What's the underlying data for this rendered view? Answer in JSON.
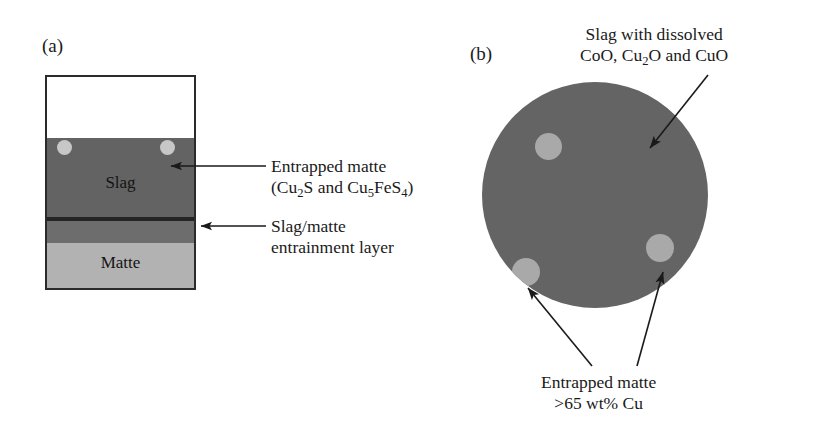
{
  "figure": {
    "panels": [
      {
        "id": "a",
        "label": "(a)",
        "layers": [
          {
            "name": "gas",
            "label": "",
            "color": "#ffffff"
          },
          {
            "name": "slag",
            "label": "Slag",
            "color": "#636363"
          },
          {
            "name": "divider",
            "label": "",
            "color": "#242424"
          },
          {
            "name": "entrainment",
            "label": "",
            "color": "#6d6d6d"
          },
          {
            "name": "matte",
            "label": "Matte",
            "color": "#b2b2b2"
          }
        ],
        "inclusion_color": "#c7c7c7",
        "callouts": [
          {
            "name": "entrapped-matte",
            "line1": "Entrapped matte",
            "line2_prefix": "(Cu",
            "line2_sub1": "2",
            "line2_mid": "S and Cu",
            "line2_sub2": "5",
            "line2_mid2": "FeS",
            "line2_sub3": "4",
            "line2_suffix": ")"
          },
          {
            "name": "slag-matte-entrainment",
            "line1": "Slag/matte",
            "line2": "entrainment layer"
          }
        ]
      },
      {
        "id": "b",
        "label": "(b)",
        "body_color": "#646464",
        "inclusion_color": "#a9a9a9",
        "callouts": [
          {
            "name": "slag-with-dissolved-oxides",
            "line1": "Slag with dissolved",
            "line2_prefix": "CoO, Cu",
            "line2_sub": "2",
            "line2_suffix": "O and CuO"
          },
          {
            "name": "entrapped-matte-copper",
            "line1": "Entrapped matte",
            "line2": ">65 wt% Cu"
          }
        ]
      }
    ],
    "colors": {
      "ink": "#1a1a1a",
      "border": "#2b2b2b",
      "slag_dark": "#636363",
      "matte_light": "#b2b2b2",
      "inclusion": "#c7c7c7"
    }
  }
}
